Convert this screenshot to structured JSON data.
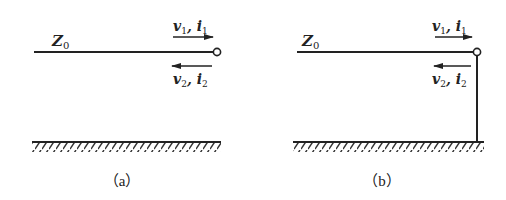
{
  "panels": [
    {
      "id": "a",
      "caption": "（a）",
      "line_label": "Z",
      "line_label_sub": "0",
      "incident_label": {
        "v": "v",
        "v_sub": "1",
        "sep": ", ",
        "i": "i",
        "i_sub": "1"
      },
      "reflected_label": {
        "v": "v",
        "v_sub": "2",
        "sep": ", ",
        "i": "i",
        "i_sub": "2"
      },
      "termination": "open"
    },
    {
      "id": "b",
      "caption": "（b）",
      "line_label": "Z",
      "line_label_sub": "0",
      "incident_label": {
        "v": "v",
        "v_sub": "1",
        "sep": ", ",
        "i": "i",
        "i_sub": "1"
      },
      "reflected_label": {
        "v": "v",
        "v_sub": "2",
        "sep": ", ",
        "i": "i",
        "i_sub": "2"
      },
      "termination": "short-to-ground"
    }
  ],
  "colors": {
    "stroke": "#222222",
    "background": "#ffffff"
  }
}
